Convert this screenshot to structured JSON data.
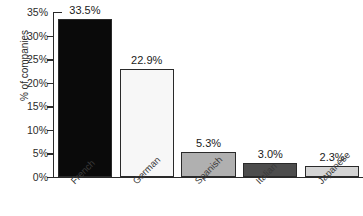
{
  "chart_data": {
    "type": "bar",
    "title": "",
    "xlabel": "",
    "ylabel": "% of companies",
    "categories": [
      "French",
      "German",
      "Spanish",
      "Italian",
      "Japanese"
    ],
    "values": [
      33.5,
      22.9,
      5.3,
      3.0,
      2.3
    ],
    "value_labels": [
      "33.5%",
      "22.9%",
      "5.3%",
      "3.0%",
      "2.3%"
    ],
    "bar_colors": [
      "#0a0a0a",
      "#f7f7f7",
      "#b0b0b0",
      "#4d4d4d",
      "#d4d4d4"
    ],
    "bar_border_color": "#2a2a2a",
    "ylim": [
      0,
      35
    ],
    "yticks": [
      0,
      5,
      10,
      15,
      20,
      25,
      30,
      35
    ],
    "ytick_labels": [
      "0%",
      "5%",
      "10%",
      "15%",
      "20%",
      "25%",
      "30%",
      "35%"
    ],
    "grid": false,
    "legend": "none"
  }
}
